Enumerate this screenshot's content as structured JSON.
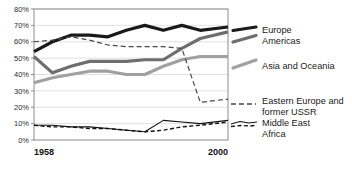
{
  "chart_data": {
    "type": "line",
    "title": "",
    "xlabel": "",
    "ylabel": "",
    "x": [
      1958,
      1962,
      1966,
      1970,
      1974,
      1978,
      1982,
      1986,
      1990,
      1994,
      2000
    ],
    "xlim": [
      1958,
      2000
    ],
    "ylim": [
      0,
      80
    ],
    "ytick_values": [
      0,
      10,
      20,
      30,
      40,
      50,
      60,
      70,
      80
    ],
    "ytick_labels": [
      "0%",
      "10%",
      "20%",
      "30%",
      "40%",
      "50%",
      "60%",
      "70%",
      "80%"
    ],
    "xtick_values": [
      1958,
      2000
    ],
    "xtick_labels": [
      "1958",
      "2000"
    ],
    "grid": true,
    "legend_position": "right",
    "series": [
      {
        "name": "Europe",
        "color": "#1a1a1a",
        "width": 3.2,
        "dash": "none",
        "values": [
          54,
          60,
          64,
          64,
          63,
          67,
          70,
          67,
          70,
          67,
          69
        ]
      },
      {
        "name": "Americas",
        "color": "#6e6e6e",
        "width": 3.2,
        "dash": "none",
        "values": [
          51,
          41,
          45,
          48,
          48,
          48,
          49,
          49,
          56,
          62,
          66
        ]
      },
      {
        "name": "Asia and Oceania",
        "color": "#a0a0a0",
        "width": 3.2,
        "dash": "none",
        "values": [
          35,
          38,
          40,
          42,
          42,
          40,
          40,
          45,
          49,
          51,
          51
        ]
      },
      {
        "name": "Eastern Europe and former USSR",
        "color": "#4a4a4a",
        "width": 1.2,
        "dash": "5,3",
        "values": [
          60,
          61,
          63,
          61,
          58,
          57,
          57,
          57,
          56,
          23,
          25
        ]
      },
      {
        "name": "Middle East",
        "color": "#111111",
        "width": 1.1,
        "dash": "none",
        "values": [
          9,
          9,
          8,
          8,
          7,
          6,
          5,
          12,
          11,
          10,
          12
        ]
      },
      {
        "name": "Africa",
        "color": "#111111",
        "width": 1.4,
        "dash": "4,2.5",
        "values": [
          9,
          8,
          8,
          7,
          7,
          6,
          5,
          6,
          8,
          9,
          11
        ]
      }
    ],
    "legend_groups": [
      {
        "lines": [
          "Europe",
          "Americas"
        ],
        "marker_series": [
          "Europe",
          "Americas"
        ]
      },
      {
        "lines": [
          "Asia and Oceania"
        ],
        "marker_series": [
          "Asia and Oceania"
        ]
      },
      {
        "lines": [
          "Eastern Europe and former USSR"
        ],
        "marker_series": [
          "Eastern Europe and former USSR"
        ]
      },
      {
        "lines": [
          "Middle East",
          "Africa"
        ],
        "marker_series": [
          "Middle East",
          "Africa"
        ]
      }
    ]
  },
  "legend": {
    "entry_1": "Europe",
    "entry_2": "Americas",
    "entry_3": "Asia and Oceania",
    "entry_4": "Eastern Europe and",
    "entry_5": "former USSR",
    "entry_6": "Middle East",
    "entry_7": "Africa"
  },
  "axis": {
    "y0": "0%",
    "y10": "10%",
    "y20": "20%",
    "y30": "30%",
    "y40": "40%",
    "y50": "50%",
    "y60": "60%",
    "y70": "70%",
    "y80": "80%",
    "x_start": "1958",
    "x_end": "2000"
  }
}
